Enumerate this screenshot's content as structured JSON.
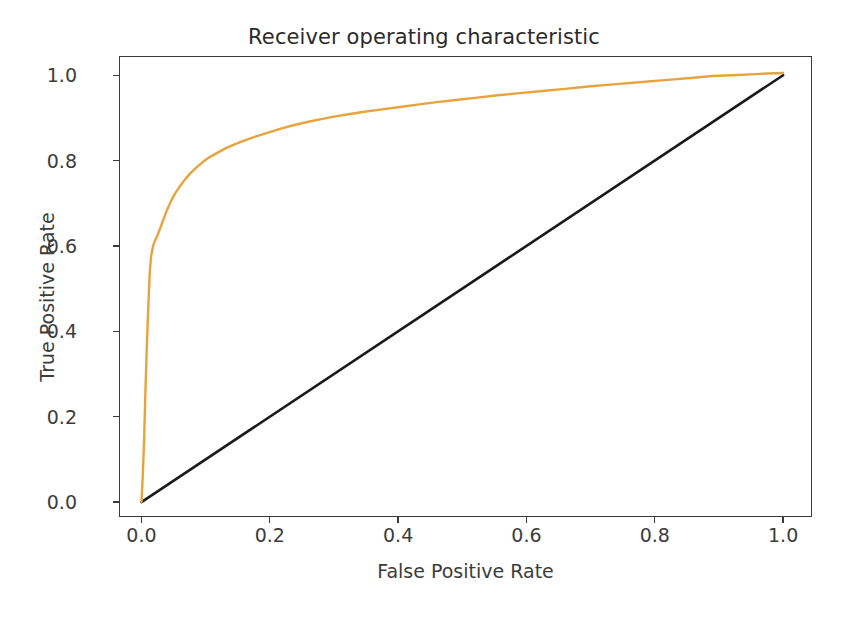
{
  "chart_data": {
    "type": "line",
    "title": "Receiver operating characteristic",
    "xlabel": "False Positive Rate",
    "ylabel": "True Positive Rate",
    "xlim": [
      -0.035,
      1.045
    ],
    "ylim": [
      -0.035,
      1.045
    ],
    "grid": false,
    "legend": null,
    "xticks": [
      "0.0",
      "0.2",
      "0.4",
      "0.6",
      "0.8",
      "1.0"
    ],
    "xtick_values": [
      0.0,
      0.2,
      0.4,
      0.6,
      0.8,
      1.0
    ],
    "yticks": [
      "0.0",
      "0.2",
      "0.4",
      "0.6",
      "0.8",
      "1.0"
    ],
    "ytick_values": [
      0.0,
      0.2,
      0.4,
      0.6,
      0.8,
      1.0
    ],
    "colors": {
      "roc_curve": "#e8a33d",
      "chance_line": "#1a1a1a",
      "axes": "#3a3a3a",
      "text": "#3c3c3c",
      "background": "#ffffff"
    },
    "series": [
      {
        "name": "ROC curve",
        "color": "#e8a33d",
        "linewidth": 2.2,
        "x": [
          0.0,
          0.002,
          0.004,
          0.005,
          0.006,
          0.007,
          0.008,
          0.009,
          0.01,
          0.011,
          0.012,
          0.013,
          0.015,
          0.018,
          0.021,
          0.025,
          0.03,
          0.035,
          0.04,
          0.046,
          0.052,
          0.06,
          0.068,
          0.076,
          0.085,
          0.095,
          0.105,
          0.118,
          0.13,
          0.145,
          0.16,
          0.175,
          0.19,
          0.205,
          0.22,
          0.24,
          0.26,
          0.28,
          0.3,
          0.325,
          0.35,
          0.375,
          0.4,
          0.43,
          0.46,
          0.49,
          0.52,
          0.555,
          0.59,
          0.625,
          0.66,
          0.7,
          0.74,
          0.78,
          0.82,
          0.86,
          0.89,
          0.92,
          0.95,
          0.975,
          1.0
        ],
        "y": [
          0.0,
          0.06,
          0.14,
          0.195,
          0.25,
          0.3,
          0.345,
          0.39,
          0.43,
          0.47,
          0.505,
          0.54,
          0.575,
          0.6,
          0.612,
          0.625,
          0.645,
          0.665,
          0.685,
          0.705,
          0.722,
          0.74,
          0.756,
          0.77,
          0.783,
          0.796,
          0.807,
          0.818,
          0.828,
          0.838,
          0.847,
          0.855,
          0.862,
          0.869,
          0.876,
          0.884,
          0.891,
          0.897,
          0.903,
          0.909,
          0.915,
          0.92,
          0.925,
          0.931,
          0.937,
          0.942,
          0.947,
          0.953,
          0.958,
          0.963,
          0.968,
          0.974,
          0.979,
          0.984,
          0.989,
          0.994,
          0.998,
          1.0,
          1.002,
          1.004,
          1.005
        ]
      },
      {
        "name": "Chance level",
        "color": "#1a1a1a",
        "linewidth": 2.4,
        "x": [
          0.0,
          1.0
        ],
        "y": [
          0.0,
          1.0
        ]
      }
    ]
  }
}
